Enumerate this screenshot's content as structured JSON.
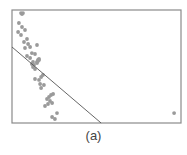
{
  "figure": {
    "caption": "(a)"
  },
  "colors": {
    "background": "#ffffff",
    "frame": "#8a8a8a",
    "line": "#555555",
    "point": "#9a9a9a"
  },
  "chart_data": {
    "type": "scatter",
    "title": "",
    "caption": "(a)",
    "xlabel": "",
    "ylabel": "",
    "xlim": [
      0,
      100
    ],
    "ylim": [
      0,
      100
    ],
    "grid": false,
    "axes_ticks": false,
    "legend": null,
    "series": [
      {
        "name": "points",
        "marker": "circle",
        "points": [
          {
            "x": 5.9,
            "y": 96.5
          },
          {
            "x": 5.3,
            "y": 97.3
          },
          {
            "x": 6.5,
            "y": 97.3
          },
          {
            "x": 4.1,
            "y": 88.5
          },
          {
            "x": 5.9,
            "y": 85.0
          },
          {
            "x": 3.6,
            "y": 80.5
          },
          {
            "x": 7.7,
            "y": 82.3
          },
          {
            "x": 5.3,
            "y": 77.9
          },
          {
            "x": 8.9,
            "y": 74.3
          },
          {
            "x": 7.1,
            "y": 71.7
          },
          {
            "x": 9.5,
            "y": 69.9
          },
          {
            "x": 7.7,
            "y": 66.4
          },
          {
            "x": 10.7,
            "y": 67.3
          },
          {
            "x": 14.8,
            "y": 69.0
          },
          {
            "x": 11.8,
            "y": 61.9
          },
          {
            "x": 8.9,
            "y": 59.3
          },
          {
            "x": 13.6,
            "y": 61.1
          },
          {
            "x": 10.7,
            "y": 57.5
          },
          {
            "x": 12.4,
            "y": 54.0
          },
          {
            "x": 15.4,
            "y": 55.8
          },
          {
            "x": 16.0,
            "y": 55.8
          },
          {
            "x": 11.8,
            "y": 52.2
          },
          {
            "x": 13.0,
            "y": 51.3
          },
          {
            "x": 14.8,
            "y": 54.0
          },
          {
            "x": 15.4,
            "y": 54.9
          },
          {
            "x": 16.0,
            "y": 56.6
          },
          {
            "x": 12.4,
            "y": 49.6
          },
          {
            "x": 13.6,
            "y": 47.8
          },
          {
            "x": 14.8,
            "y": 53.1
          },
          {
            "x": 13.6,
            "y": 38.9
          },
          {
            "x": 17.2,
            "y": 40.7
          },
          {
            "x": 18.3,
            "y": 42.5
          },
          {
            "x": 16.0,
            "y": 38.1
          },
          {
            "x": 18.9,
            "y": 33.6
          },
          {
            "x": 16.6,
            "y": 34.5
          },
          {
            "x": 17.2,
            "y": 31.0
          },
          {
            "x": 21.9,
            "y": 23.0
          },
          {
            "x": 23.1,
            "y": 24.8
          },
          {
            "x": 24.3,
            "y": 25.7
          },
          {
            "x": 20.7,
            "y": 21.2
          },
          {
            "x": 22.5,
            "y": 19.5
          },
          {
            "x": 19.5,
            "y": 15.0
          },
          {
            "x": 21.3,
            "y": 16.8
          },
          {
            "x": 23.7,
            "y": 17.7
          },
          {
            "x": 23.7,
            "y": 5.3
          },
          {
            "x": 25.4,
            "y": 3.5
          },
          {
            "x": 26.6,
            "y": 8.8
          },
          {
            "x": 95.9,
            "y": 8.8
          }
        ]
      }
    ],
    "lines": [
      {
        "name": "decision-boundary",
        "x": [
          0,
          52.7
        ],
        "y": [
          67.3,
          0
        ]
      }
    ]
  }
}
